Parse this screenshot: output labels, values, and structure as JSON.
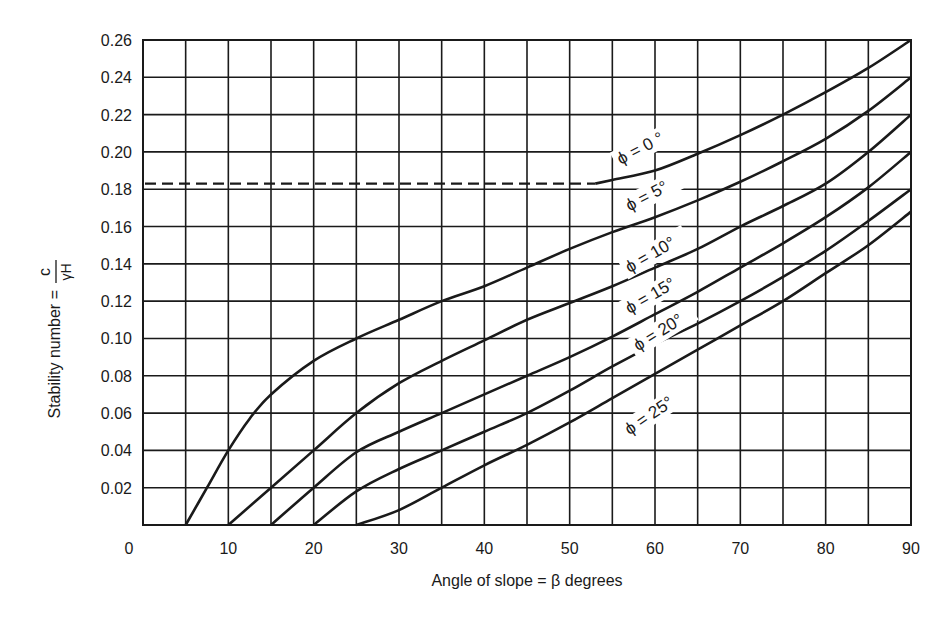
{
  "chart_data": {
    "type": "line",
    "title": "",
    "xlabel": "Angle of slope = β degrees",
    "ylabel": "Stability number = c / γH",
    "ylabel_prefix": "Stability number =",
    "ylabel_num": "c",
    "ylabel_den": "γH",
    "xlim": [
      0,
      90
    ],
    "ylim": [
      0,
      0.26
    ],
    "grid": true,
    "legend": "inline labels on curves",
    "x_ticks": [
      0,
      10,
      20,
      30,
      40,
      50,
      60,
      70,
      80,
      90
    ],
    "x_tick_labels": [
      "0",
      "10",
      "20",
      "30",
      "40",
      "50",
      "60",
      "70",
      "80",
      "90"
    ],
    "y_ticks": [
      0.02,
      0.04,
      0.06,
      0.08,
      0.1,
      0.12,
      0.14,
      0.16,
      0.18,
      0.2,
      0.22,
      0.24,
      0.26
    ],
    "y_tick_labels": [
      "0.02",
      "0.04",
      "0.06",
      "0.08",
      "0.10",
      "0.12",
      "0.14",
      "0.16",
      "0.18",
      "0.20",
      "0.22",
      "0.24",
      "0.26"
    ],
    "series": [
      {
        "name": "φ = 0 °",
        "label": "ϕ = 0 °",
        "dashed_segment": {
          "x": [
            0,
            53
          ],
          "y": [
            0.183,
            0.183
          ]
        },
        "x": [
          53,
          55,
          60,
          65,
          70,
          75,
          80,
          85,
          90
        ],
        "y": [
          0.183,
          0.185,
          0.19,
          0.199,
          0.209,
          0.22,
          0.232,
          0.245,
          0.26
        ],
        "label_pos": {
          "x": 56,
          "y": 0.193,
          "angle": -28
        }
      },
      {
        "name": "φ = 5°",
        "label": "ϕ = 5°",
        "x": [
          5,
          7.5,
          10,
          12.5,
          15,
          20,
          25,
          30,
          35,
          40,
          45,
          50,
          55,
          60,
          65,
          70,
          75,
          80,
          85,
          90
        ],
        "y": [
          0,
          0.02,
          0.04,
          0.057,
          0.07,
          0.088,
          0.1,
          0.11,
          0.12,
          0.128,
          0.138,
          0.148,
          0.157,
          0.165,
          0.174,
          0.184,
          0.195,
          0.207,
          0.222,
          0.24
        ],
        "label_pos": {
          "x": 57,
          "y": 0.168,
          "angle": -28
        }
      },
      {
        "name": "φ = 10°",
        "label": "ϕ = 10°",
        "x": [
          10,
          15,
          20,
          25,
          30,
          35,
          40,
          45,
          50,
          55,
          60,
          65,
          70,
          75,
          80,
          85,
          90
        ],
        "y": [
          0,
          0.02,
          0.04,
          0.06,
          0.076,
          0.088,
          0.099,
          0.11,
          0.119,
          0.128,
          0.138,
          0.148,
          0.16,
          0.171,
          0.183,
          0.2,
          0.22
        ],
        "label_pos": {
          "x": 57,
          "y": 0.135,
          "angle": -30
        }
      },
      {
        "name": "φ = 15°",
        "label": "ϕ = 15°",
        "x": [
          15,
          20,
          25,
          30,
          35,
          40,
          45,
          50,
          55,
          60,
          65,
          70,
          75,
          80,
          85,
          90
        ],
        "y": [
          0,
          0.02,
          0.039,
          0.05,
          0.06,
          0.07,
          0.08,
          0.09,
          0.101,
          0.113,
          0.125,
          0.138,
          0.151,
          0.165,
          0.181,
          0.2
        ],
        "label_pos": {
          "x": 57,
          "y": 0.113,
          "angle": -30
        }
      },
      {
        "name": "φ = 20°",
        "label": "ϕ = 20°",
        "x": [
          20,
          25,
          30,
          35,
          40,
          45,
          50,
          55,
          60,
          65,
          70,
          75,
          80,
          85,
          90
        ],
        "y": [
          0,
          0.018,
          0.03,
          0.04,
          0.05,
          0.06,
          0.072,
          0.085,
          0.097,
          0.108,
          0.12,
          0.133,
          0.147,
          0.163,
          0.18
        ],
        "label_pos": {
          "x": 58,
          "y": 0.093,
          "angle": -32
        }
      },
      {
        "name": "φ = 25°",
        "label": "ϕ = 25°",
        "x": [
          25,
          30,
          35,
          40,
          45,
          50,
          55,
          60,
          65,
          70,
          75,
          80,
          85,
          90
        ],
        "y": [
          0,
          0.008,
          0.02,
          0.032,
          0.043,
          0.055,
          0.068,
          0.081,
          0.094,
          0.107,
          0.12,
          0.135,
          0.15,
          0.168
        ],
        "label_pos": {
          "x": 57,
          "y": 0.048,
          "angle": -34
        }
      }
    ]
  }
}
